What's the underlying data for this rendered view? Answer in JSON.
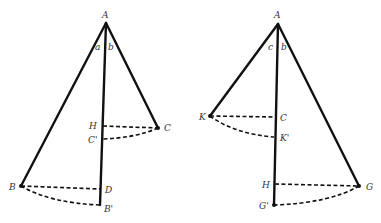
{
  "left_figure": {
    "labels": {
      "A": "A",
      "a": "a",
      "b": "b",
      "H": "H",
      "C": "C",
      "C_prime": "C'",
      "B": "B",
      "D": "D",
      "B_prime": "B'"
    }
  },
  "right_figure": {
    "labels": {
      "A": "A",
      "c": "c",
      "b": "b",
      "K": "K",
      "C": "C",
      "K_prime": "K'",
      "H": "H",
      "G": "G",
      "G_prime": "G'"
    }
  }
}
